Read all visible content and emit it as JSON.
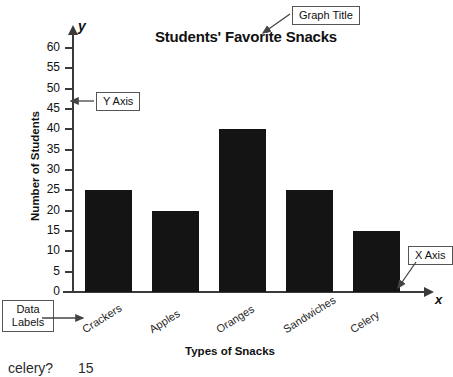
{
  "chart_data": {
    "type": "bar",
    "title": "Students' Favorite Snacks",
    "xlabel": "Types of Snacks",
    "ylabel": "Number of Students",
    "categories": [
      "Crackers",
      "Apples",
      "Oranges",
      "Sandwiches",
      "Celery"
    ],
    "values": [
      25,
      20,
      40,
      25,
      15
    ],
    "ylim": [
      0,
      60
    ],
    "ytick_step": 5,
    "yticks": [
      "0",
      "5",
      "10",
      "15",
      "20",
      "25",
      "30",
      "35",
      "40",
      "45",
      "50",
      "55",
      "60"
    ],
    "grid": false,
    "legend": null,
    "bar_color": "#141414",
    "axis_color": "#3a3a3a",
    "axis_letters": {
      "x": "x",
      "y": "y"
    }
  },
  "annotations": {
    "graph_title_callout": "Graph Title",
    "y_axis_callout": "Y Axis",
    "x_axis_callout": "X Axis",
    "data_labels_callout_line1": "Data",
    "data_labels_callout_line2": "Labels"
  },
  "page_footer": {
    "cut_question": "celery?",
    "cut_answer": "15"
  }
}
